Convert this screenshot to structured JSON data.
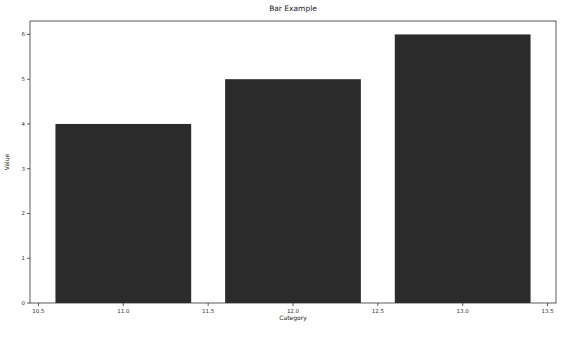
{
  "chart_data": {
    "type": "bar",
    "title": "Bar Example",
    "xlabel": "Category",
    "ylabel": "Value",
    "x": [
      11.0,
      12.0,
      13.0
    ],
    "categories": [
      "11.0",
      "12.0",
      "13.0"
    ],
    "values": [
      4,
      5,
      6
    ],
    "bar_width": 0.8,
    "bar_color": "#2b2b2b",
    "xlim": [
      10.45,
      13.55
    ],
    "ylim": [
      0,
      6.3
    ],
    "xticks": [
      10.5,
      11.0,
      11.5,
      12.0,
      12.5,
      13.0,
      13.5
    ],
    "xtick_labels": [
      "10.5",
      "11.0",
      "11.5",
      "12.0",
      "12.5",
      "13.0",
      "13.5"
    ],
    "yticks": [
      0,
      1,
      2,
      3,
      4,
      5,
      6
    ],
    "ytick_labels": [
      "0",
      "1",
      "2",
      "3",
      "4",
      "5",
      "6"
    ],
    "grid": false,
    "legend": null
  }
}
